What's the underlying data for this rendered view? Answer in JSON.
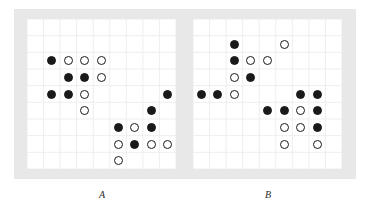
{
  "figure": {
    "width": 370,
    "height": 221,
    "background_color": "#ffffff",
    "frame_color": "#e8e8e8",
    "panel_background": "#ffffff",
    "grid_line_color": "#eeeeee",
    "marker_color": "#1a1a1a"
  },
  "panels": [
    {
      "id": "A",
      "label": "A",
      "left": 27,
      "top": 19,
      "width": 149,
      "height": 150,
      "cols": 9,
      "rows": 9,
      "markers": [
        {
          "col": 1,
          "row": 2,
          "type": "filled"
        },
        {
          "col": 2,
          "row": 2,
          "type": "open"
        },
        {
          "col": 3,
          "row": 2,
          "type": "open"
        },
        {
          "col": 4,
          "row": 2,
          "type": "open"
        },
        {
          "col": 2,
          "row": 3,
          "type": "filled"
        },
        {
          "col": 3,
          "row": 3,
          "type": "filled"
        },
        {
          "col": 4,
          "row": 3,
          "type": "open"
        },
        {
          "col": 1,
          "row": 4,
          "type": "filled"
        },
        {
          "col": 2,
          "row": 4,
          "type": "filled"
        },
        {
          "col": 3,
          "row": 4,
          "type": "open"
        },
        {
          "col": 8,
          "row": 4,
          "type": "filled"
        },
        {
          "col": 3,
          "row": 5,
          "type": "open"
        },
        {
          "col": 7,
          "row": 5,
          "type": "filled"
        },
        {
          "col": 5,
          "row": 6,
          "type": "filled"
        },
        {
          "col": 6,
          "row": 6,
          "type": "open"
        },
        {
          "col": 7,
          "row": 6,
          "type": "filled"
        },
        {
          "col": 5,
          "row": 7,
          "type": "open"
        },
        {
          "col": 6,
          "row": 7,
          "type": "filled"
        },
        {
          "col": 7,
          "row": 7,
          "type": "open"
        },
        {
          "col": 8,
          "row": 7,
          "type": "open"
        },
        {
          "col": 5,
          "row": 8,
          "type": "open"
        }
      ]
    },
    {
      "id": "B",
      "label": "B",
      "left": 193,
      "top": 19,
      "width": 149,
      "height": 150,
      "cols": 9,
      "rows": 9,
      "markers": [
        {
          "col": 2,
          "row": 1,
          "type": "filled"
        },
        {
          "col": 5,
          "row": 1,
          "type": "open"
        },
        {
          "col": 2,
          "row": 2,
          "type": "filled"
        },
        {
          "col": 3,
          "row": 2,
          "type": "open"
        },
        {
          "col": 4,
          "row": 2,
          "type": "open"
        },
        {
          "col": 2,
          "row": 3,
          "type": "open"
        },
        {
          "col": 3,
          "row": 3,
          "type": "filled"
        },
        {
          "col": 0,
          "row": 4,
          "type": "filled"
        },
        {
          "col": 1,
          "row": 4,
          "type": "filled"
        },
        {
          "col": 2,
          "row": 4,
          "type": "open"
        },
        {
          "col": 6,
          "row": 4,
          "type": "filled"
        },
        {
          "col": 7,
          "row": 4,
          "type": "filled"
        },
        {
          "col": 4,
          "row": 5,
          "type": "filled"
        },
        {
          "col": 5,
          "row": 5,
          "type": "filled"
        },
        {
          "col": 6,
          "row": 5,
          "type": "open"
        },
        {
          "col": 7,
          "row": 5,
          "type": "filled"
        },
        {
          "col": 5,
          "row": 6,
          "type": "open"
        },
        {
          "col": 6,
          "row": 6,
          "type": "open"
        },
        {
          "col": 7,
          "row": 6,
          "type": "filled"
        },
        {
          "col": 5,
          "row": 7,
          "type": "open"
        },
        {
          "col": 7,
          "row": 7,
          "type": "open"
        }
      ]
    }
  ],
  "labels": [
    {
      "text": "A",
      "left": 82,
      "top": 189
    },
    {
      "text": "B",
      "left": 248,
      "top": 189
    }
  ],
  "chart_data": {
    "type": "scatter",
    "title": "",
    "xlabel": "",
    "ylabel": "",
    "grid": true,
    "legend_position": "none",
    "marker_types": [
      "filled",
      "open"
    ],
    "panels": [
      {
        "name": "A",
        "xlim": [
          0,
          9
        ],
        "ylim": [
          0,
          9
        ],
        "series": [
          {
            "name": "filled",
            "points": [
              [
                1,
                2
              ],
              [
                2,
                3
              ],
              [
                3,
                3
              ],
              [
                1,
                4
              ],
              [
                2,
                4
              ],
              [
                8,
                4
              ],
              [
                7,
                5
              ],
              [
                5,
                6
              ],
              [
                7,
                6
              ],
              [
                6,
                7
              ]
            ]
          },
          {
            "name": "open",
            "points": [
              [
                2,
                2
              ],
              [
                3,
                2
              ],
              [
                4,
                2
              ],
              [
                4,
                3
              ],
              [
                3,
                4
              ],
              [
                3,
                5
              ],
              [
                6,
                6
              ],
              [
                5,
                7
              ],
              [
                7,
                7
              ],
              [
                8,
                7
              ],
              [
                5,
                8
              ]
            ]
          }
        ],
        "counts": {
          "filled": 10,
          "open": 11,
          "total": 21
        }
      },
      {
        "name": "B",
        "xlim": [
          0,
          9
        ],
        "ylim": [
          0,
          9
        ],
        "series": [
          {
            "name": "filled",
            "points": [
              [
                2,
                1
              ],
              [
                2,
                2
              ],
              [
                3,
                3
              ],
              [
                0,
                4
              ],
              [
                1,
                4
              ],
              [
                6,
                4
              ],
              [
                7,
                4
              ],
              [
                4,
                5
              ],
              [
                5,
                5
              ],
              [
                7,
                5
              ],
              [
                7,
                6
              ]
            ]
          },
          {
            "name": "open",
            "points": [
              [
                5,
                1
              ],
              [
                3,
                2
              ],
              [
                4,
                2
              ],
              [
                2,
                3
              ],
              [
                2,
                4
              ],
              [
                6,
                5
              ],
              [
                5,
                6
              ],
              [
                6,
                6
              ],
              [
                5,
                7
              ],
              [
                7,
                7
              ]
            ]
          }
        ],
        "counts": {
          "filled": 11,
          "open": 10,
          "total": 21
        }
      }
    ]
  }
}
